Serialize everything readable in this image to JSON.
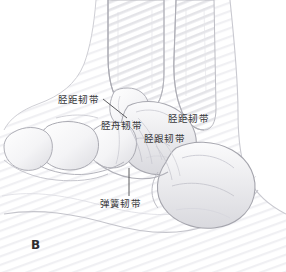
{
  "figure": {
    "panel_letter": "B",
    "view": "medial-ankle-ligaments",
    "style": "graphite-pencil-medical-illustration",
    "background_color": "#ffffff",
    "line_color": "#9a9a9e",
    "text_color": "#38383a",
    "shading_color": "#d8d8dc"
  },
  "labels": {
    "tibiotalar_left": "胫距韧带",
    "tibionavicular": "胫舟韧带",
    "tibiotalar_right": "胫距韧带",
    "tibiocalcaneal": "胫跟韧带",
    "spring_ligament": "弹簧韧带"
  },
  "leader_lines": [
    {
      "name": "tibiotalar-left-leader",
      "from": [
        103,
        99
      ],
      "to": [
        127,
        118
      ]
    },
    {
      "name": "spring-ligament-leader",
      "from": [
        129,
        168
      ],
      "to": [
        129,
        196
      ]
    }
  ],
  "anatomy": {
    "bones": [
      "tibia",
      "fibula",
      "talus",
      "calcaneus",
      "navicular",
      "cuneiform",
      "metatarsal"
    ]
  }
}
